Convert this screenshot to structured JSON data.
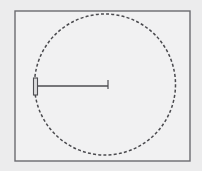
{
  "canvas": {
    "width": 202,
    "height": 171,
    "background_color": "#ececed"
  },
  "figure": {
    "title": ""
  },
  "frame": {
    "name": "outer-rectangle",
    "x": 15,
    "y": 11,
    "width": 175,
    "height": 150,
    "stroke_color": "#6b6b70",
    "stroke_width": 1.4,
    "fill_color": "#f1f1f2"
  },
  "circle": {
    "name": "dashed-circle",
    "center_x": 105,
    "center_y": 84.5,
    "radius": 70.5,
    "stroke_color": "#4a4a4e",
    "stroke_width": 1.5,
    "dash_pattern": "3 2.2",
    "fill": "none"
  },
  "radius_line": {
    "name": "radius-dimension-line",
    "x1": 36,
    "y1": 86,
    "x2": 108,
    "y2": 86,
    "stroke_color": "#4d4d51",
    "stroke_width": 1.3,
    "length_px": 72
  },
  "left_marker": {
    "name": "left-end-bar",
    "x": 33.5,
    "y": 78,
    "width": 4,
    "height": 17,
    "stroke_color": "#4d4d51",
    "fill_color": "#dcdcdd",
    "stroke_width": 1.1
  },
  "right_marker": {
    "name": "right-end-tick",
    "x": 108,
    "y_top": 80,
    "y_bottom": 89,
    "stroke_color": "#4d4d51",
    "stroke_width": 1.2
  }
}
